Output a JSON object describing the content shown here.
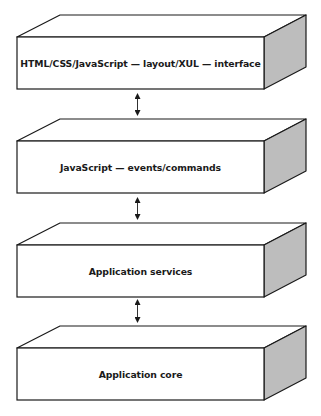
{
  "diagram": {
    "layers": [
      {
        "label": "HTML/CSS/JavaScript — layout/XUL — interface"
      },
      {
        "label": "JavaScript — events/commands"
      },
      {
        "label": "Application services"
      },
      {
        "label": "Application core"
      }
    ],
    "connectors": [
      {
        "from": 0,
        "to": 1,
        "type": "bidirectional-arrow"
      },
      {
        "from": 1,
        "to": 2,
        "type": "bidirectional-arrow"
      },
      {
        "from": 2,
        "to": 3,
        "type": "bidirectional-arrow"
      }
    ],
    "colors": {
      "stroke": "#1a1a1a",
      "front_face": "#ffffff",
      "top_face": "#ffffff",
      "side_face": "#bdbdbd"
    }
  }
}
